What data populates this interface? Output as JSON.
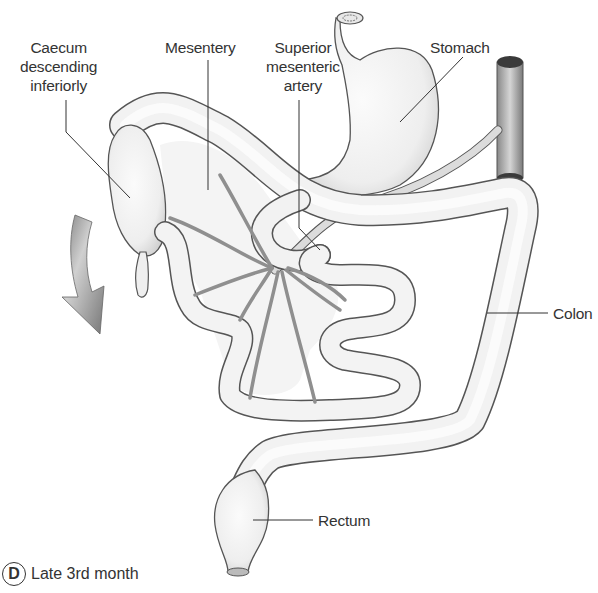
{
  "figure": {
    "panel_letter": "D",
    "caption": "Late 3rd month"
  },
  "labels": {
    "caecum": [
      "Caecum",
      "descending",
      "inferiorly"
    ],
    "mesentery": "Mesentery",
    "sma": [
      "Superior",
      "mesenteric",
      "artery"
    ],
    "stomach": "Stomach",
    "colon": "Colon",
    "rectum": "Rectum"
  },
  "colors": {
    "tube_fill": "#f0f0f0",
    "tube_stroke": "#555555",
    "vessel": "#9a9a9a",
    "arrow": "#8c8c8c",
    "aorta_cap": "#3a3a3a",
    "text": "#333333"
  }
}
